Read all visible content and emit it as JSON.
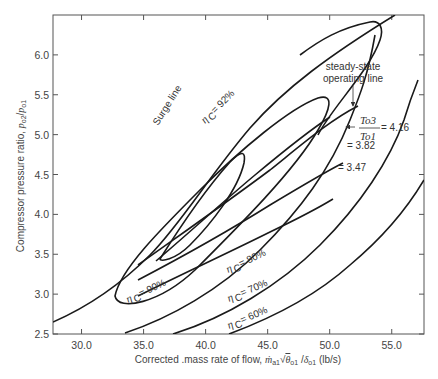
{
  "chart_data": {
    "type": "line",
    "title": "",
    "xlabel": "Corrected .mass rate of flow, ṁa1√θo1 /δo1 (lb/s)",
    "ylabel": "Compressor pressure ratio, po2/po1",
    "xlim": [
      27.7,
      57.6
    ],
    "ylim": [
      2.5,
      6.5
    ],
    "grid": false,
    "x_ticks": [
      "30.0",
      "35.0",
      "40.0",
      "45.0",
      "50.0",
      "55.0"
    ],
    "y_ticks": [
      "2.5",
      "3.0",
      "3.5",
      "4.0",
      "4.5",
      "5.0",
      "5.5",
      "6.0"
    ],
    "series": [
      {
        "name": "Surge line",
        "kind": "line",
        "x": [
          27.7,
          31.0,
          34.5,
          38.0,
          41.5,
          45.0,
          48.5,
          52.0,
          54.5
        ],
        "y": [
          2.68,
          2.92,
          3.3,
          3.78,
          4.32,
          4.95,
          5.5,
          6.05,
          6.45
        ]
      },
      {
        "name": "steady-state operating line",
        "kind": "line",
        "x": [
          36.5,
          40.0,
          43.5,
          46.5,
          48.5,
          50.0,
          51.2
        ],
        "y": [
          3.4,
          3.8,
          4.25,
          4.65,
          4.9,
          5.1,
          5.25
        ]
      },
      {
        "name": "To3/To1 = 4.16",
        "kind": "speed-line",
        "x": [
          35.2,
          39.0,
          43.0,
          46.5,
          49.5,
          51.8
        ],
        "y": [
          3.45,
          3.85,
          4.3,
          4.7,
          5.05,
          5.37
        ]
      },
      {
        "name": "To3/To1 = 3.82",
        "kind": "speed-line",
        "x": [
          35.2,
          39.0,
          43.0,
          46.5,
          49.5,
          52.0
        ],
        "y": [
          3.27,
          3.62,
          4.02,
          4.38,
          4.67,
          4.92
        ]
      },
      {
        "name": "To3/To1 = 3.47",
        "kind": "speed-line",
        "x": [
          35.2,
          39.0,
          43.0,
          46.5,
          49.0,
          50.5
        ],
        "y": [
          3.07,
          3.4,
          3.75,
          4.07,
          4.35,
          4.55
        ]
      },
      {
        "name": "ηC = 92%",
        "kind": "efficiency-contour",
        "x": [
          36.5,
          38.0,
          40.5,
          42.0,
          41.8,
          40.2,
          38.3,
          36.5
        ],
        "y": [
          3.43,
          3.9,
          4.55,
          4.85,
          4.62,
          4.05,
          3.6,
          3.43
        ]
      },
      {
        "name": "ηC = 90%",
        "kind": "efficiency-contour",
        "x": [
          34.5,
          36.0,
          39.0,
          43.0,
          46.5,
          48.0,
          46.0,
          43.0,
          39.0,
          35.5,
          34.5
        ],
        "y": [
          2.8,
          3.15,
          3.8,
          4.55,
          5.15,
          5.52,
          5.0,
          4.05,
          3.15,
          2.72,
          2.8
        ]
      },
      {
        "name": "ηC = 80%",
        "kind": "efficiency-contour",
        "x": [
          36.0,
          39.5,
          43.0,
          46.5,
          49.0,
          51.0,
          52.5
        ],
        "y": [
          2.52,
          2.85,
          3.28,
          3.88,
          4.42,
          5.0,
          5.7
        ]
      },
      {
        "name": "ηC = 70%",
        "kind": "efficiency-contour",
        "x": [
          38.5,
          42.0,
          46.0,
          49.5,
          52.5,
          55.0,
          56.5
        ],
        "y": [
          2.5,
          2.78,
          3.25,
          3.8,
          4.4,
          5.05,
          5.55
        ]
      },
      {
        "name": "ηC = 60%",
        "kind": "efficiency-contour",
        "x": [
          41.0,
          45.0,
          49.0,
          52.5,
          55.5,
          57.6
        ],
        "y": [
          2.5,
          2.8,
          3.28,
          3.8,
          4.3,
          4.7
        ]
      }
    ],
    "annotations": [
      {
        "text": "Surge line",
        "x": 32.5,
        "y": 4.5,
        "rotation": -55
      },
      {
        "text": "ηC = 92%",
        "x": 37.0,
        "y": 4.3,
        "rotation": -45
      },
      {
        "text": "steady-state",
        "x": 51.5,
        "y": 5.85
      },
      {
        "text": "operating line",
        "x": 51.5,
        "y": 5.6
      },
      {
        "text": "To3/To1 = 4.16",
        "x": 52.0,
        "y": 5.0
      },
      {
        "text": "= 3.82",
        "x": 51.0,
        "y": 4.78
      },
      {
        "text": "= 3.47",
        "x": 50.5,
        "y": 4.42
      },
      {
        "text": "ηC = 90%",
        "x": 34.5,
        "y": 2.78,
        "rotation": -28
      },
      {
        "text": "ηC = 80%",
        "x": 42.0,
        "y": 3.2,
        "rotation": -28
      },
      {
        "text": "ηC = 70%",
        "x": 42.5,
        "y": 2.8,
        "rotation": -25
      },
      {
        "text": "ηC = 60%",
        "x": 42.5,
        "y": 2.55,
        "rotation": -25
      }
    ]
  },
  "labels": {
    "xlabel_prefix": "Corrected .mass rate of flow, ",
    "xlabel_suffix": " (lb/s)",
    "ylabel_prefix": "Compressor pressure ratio, ",
    "surge": "Surge line",
    "eta92": "= 92%",
    "eta90": "= 90%",
    "eta80": "= 80%",
    "eta70": "= 70%",
    "eta60": "= 60%",
    "eta_sym": "η",
    "eta_sub": "C",
    "steady1": "steady-state",
    "steady2": "operating line",
    "t_num": "To3",
    "t_den": "To1",
    "v416": "= 4.16",
    "v382": "= 3.82",
    "v347": "= 3.47"
  }
}
